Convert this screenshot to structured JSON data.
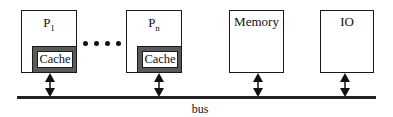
{
  "diagram": {
    "type": "shared-bus multiprocessor",
    "nodes": [
      {
        "id": "p1",
        "label": "P",
        "subscript": "1",
        "has_cache": true,
        "cache_label": "Cache"
      },
      {
        "id": "pn",
        "label": "P",
        "subscript": "n",
        "has_cache": true,
        "cache_label": "Cache"
      },
      {
        "id": "memory",
        "label": "Memory",
        "has_cache": false
      },
      {
        "id": "io",
        "label": "IO",
        "has_cache": false
      }
    ],
    "ellipsis": "....",
    "bus": {
      "label": "bus"
    },
    "edges": [
      {
        "from": "p1",
        "to": "bus",
        "type": "bidirectional"
      },
      {
        "from": "pn",
        "to": "bus",
        "type": "bidirectional"
      },
      {
        "from": "memory",
        "to": "bus",
        "type": "bidirectional"
      },
      {
        "from": "io",
        "to": "bus",
        "type": "bidirectional"
      }
    ]
  },
  "labels": {
    "p1_main": "P",
    "p1_sub": "1",
    "pn_main": "P",
    "pn_sub": "n",
    "cache1": "Cache",
    "cachen": "Cache",
    "memory": "Memory",
    "io": "IO",
    "bus": "bus"
  }
}
